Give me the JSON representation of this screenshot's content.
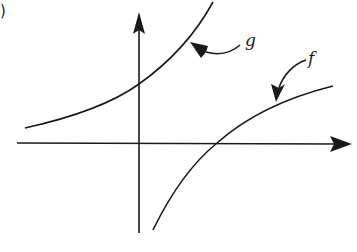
{
  "figure": {
    "part_label": ")",
    "curves": [
      {
        "name": "g",
        "label": "g",
        "description": "increasing curve, concave up, crossing y-axis above x-axis"
      },
      {
        "name": "f",
        "label": "f",
        "description": "increasing curve, concave down, crossing x-axis right of origin"
      }
    ],
    "axes": {
      "x_arrow": true,
      "y_arrow": true
    },
    "colors": {
      "stroke": "#1a1a1a",
      "background": "#ffffff"
    }
  }
}
